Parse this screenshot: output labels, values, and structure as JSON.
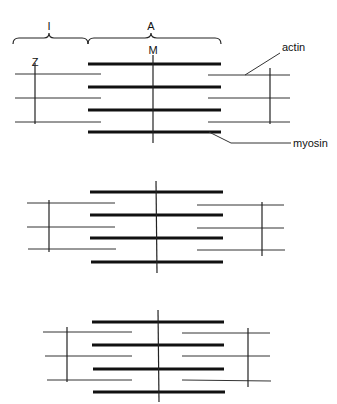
{
  "labels": {
    "I_band": "I",
    "A_band": "A",
    "M_line": "M",
    "Z_line": "Z",
    "actin": "actin",
    "myosin": "myosin"
  },
  "sarcomeres": [
    {
      "state": "relaxed",
      "thick_x": [
        88,
        221
      ],
      "thick_y": [
        64,
        87,
        110,
        132
      ],
      "m_x": 153,
      "m_y": [
        55,
        143
      ],
      "left_thin_x": [
        15,
        101
      ],
      "right_thin_x": [
        208,
        290
      ],
      "left_thin_y": [
        74,
        98,
        122
      ],
      "right_thin_y": [
        75,
        98,
        122
      ],
      "left_z_x": 35,
      "left_z_y": [
        63,
        124
      ],
      "right_z_x": 270,
      "right_z_y": [
        68,
        124
      ]
    },
    {
      "state": "partially-contracted",
      "thick_x": [
        90,
        223
      ],
      "thick_y": [
        192,
        215,
        238,
        262
      ],
      "m_x": 156,
      "m_y": [
        181,
        273
      ],
      "left_thin_x": [
        27,
        115
      ],
      "right_thin_x": [
        197,
        284
      ],
      "left_thin_y": [
        203,
        227,
        249
      ],
      "right_thin_y": [
        205,
        228,
        250
      ],
      "left_z_x": 49,
      "left_z_y": [
        200,
        252
      ],
      "right_z_x": 262,
      "right_z_y": [
        202,
        256
      ]
    },
    {
      "state": "contracted",
      "thick_x": [
        92,
        224
      ],
      "thick_y": [
        322,
        345,
        369,
        392
      ],
      "m_x": 158,
      "m_y": [
        310,
        402
      ],
      "left_thin_x": [
        43,
        132
      ],
      "right_thin_x": [
        182,
        270
      ],
      "left_thin_y": [
        332,
        356,
        380
      ],
      "right_thin_y": [
        333,
        356,
        380
      ],
      "left_z_x": 67,
      "left_z_y": [
        327,
        382
      ],
      "right_z_x": 248,
      "right_z_y": [
        328,
        387
      ]
    }
  ],
  "colors": {
    "line": "#222222",
    "background": "#ffffff"
  }
}
